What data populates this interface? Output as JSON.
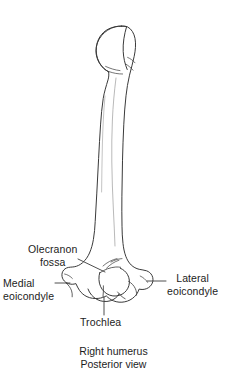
{
  "figure": {
    "view": "posterior",
    "background_color": "#ffffff",
    "line_color": "#3a3a3a",
    "text_color": "#1c1c1c"
  },
  "labels": [
    {
      "name": "olecranon-fossa",
      "line1": "Olecranon",
      "line2": "fossa",
      "leader": "diagonal-down-right"
    },
    {
      "name": "medial-epicondyle",
      "line1": "Medial",
      "line2": "eoicondyle",
      "leader": "horizontal-right"
    },
    {
      "name": "lateral-epicondyle",
      "line1": "Lateral",
      "line2": "eoicondyle",
      "leader": "horizontal-left"
    },
    {
      "name": "trochlea",
      "line1": "Trochlea",
      "line2": "",
      "leader": "vertical-up"
    }
  ],
  "caption": {
    "line1": "Right humerus",
    "line2": "Posterior view"
  }
}
